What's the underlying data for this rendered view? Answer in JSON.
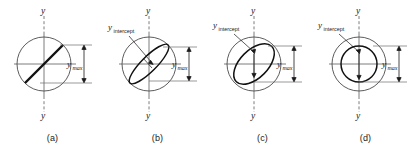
{
  "figure": {
    "background_color": "#ffffff",
    "ink_color": "#111111",
    "guide_color": "#6e6e6e",
    "label_y_axis": "y",
    "label_y_max_base": "y",
    "label_y_max_sub": "max",
    "label_y_intercept_base": "y",
    "label_y_intercept_sub": "intercept"
  },
  "panels": [
    {
      "id": "a",
      "caption": "(a)",
      "shape_type": "line",
      "has_y_intercept_label": false,
      "has_y_max_bracket": true,
      "description": "circle with diagonal straight line through origin, linear polarization"
    },
    {
      "id": "b",
      "caption": "(b)",
      "shape_type": "narrow-ellipse",
      "has_y_intercept_label": true,
      "has_y_max_bracket": true,
      "description": "circle with narrow tilted ellipse, small y-intercept"
    },
    {
      "id": "c",
      "caption": "(c)",
      "shape_type": "wide-ellipse",
      "has_y_intercept_label": true,
      "has_y_max_bracket": true,
      "description": "circle with wider tilted ellipse, larger y-intercept"
    },
    {
      "id": "d",
      "caption": "(d)",
      "shape_type": "inner-circle",
      "has_y_intercept_label": true,
      "has_y_max_bracket": true,
      "description": "outer circle with concentric inner circle, y-intercept equals y-max"
    }
  ]
}
